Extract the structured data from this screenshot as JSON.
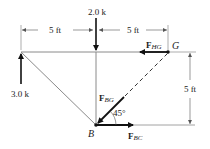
{
  "diagram": {
    "dimensions": {
      "top_left": "5 ft",
      "top_right": "5 ft",
      "right_vertical": "5 ft"
    },
    "loads": {
      "downward": "2.0 k",
      "upward": "3.0 k"
    },
    "forces": {
      "hg": {
        "F": "F",
        "sub": "HG"
      },
      "bg": {
        "F": "F",
        "sub": "BG"
      },
      "bc": {
        "F": "F",
        "sub": "BC"
      }
    },
    "nodes": {
      "g": "G",
      "b": "B"
    },
    "angle": "45°",
    "colors": {
      "member": "#8a8a8a",
      "arrow": "#111111",
      "dim": "#555555"
    }
  }
}
